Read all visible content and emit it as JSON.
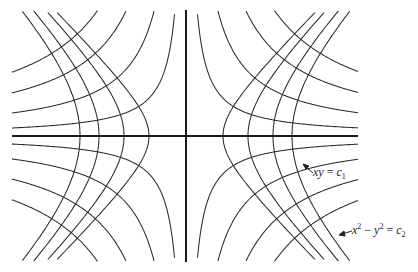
{
  "figure": {
    "center": [
      186,
      136
    ],
    "bounds": {
      "x_min": 12,
      "x_max": 358,
      "y_min": 10,
      "y_max": 262
    },
    "family_xy": {
      "equation": "xy = c1",
      "k_values": [
        1400,
        4000,
        7500,
        11100
      ]
    },
    "family_x2y2": {
      "equation": "x^2 - y^2 = c2",
      "a_values": [
        37,
        62,
        87,
        106
      ]
    },
    "stroke_color": "#2a2a2a"
  },
  "labels": {
    "xy": {
      "lhs": "xy",
      "eq": " = ",
      "c": "c",
      "sub": "1"
    },
    "x2y2": {
      "x": "x",
      "sup1": "2",
      "minus": " − ",
      "y": "y",
      "sup2": "2",
      "eq": " = ",
      "c": "c",
      "sub": "2"
    }
  }
}
